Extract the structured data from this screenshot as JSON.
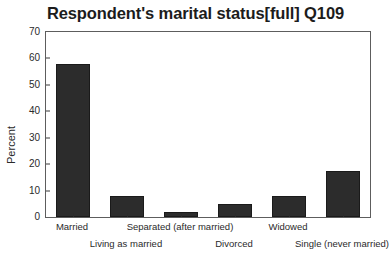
{
  "chart_data": {
    "type": "bar",
    "title": "Respondent's marital status[full] Q109",
    "xlabel": "",
    "ylabel": "Percent",
    "categories": [
      "Married",
      "Living as married",
      "Separated (after married)",
      "Divorced",
      "Widowed",
      "Single (never married)"
    ],
    "values": [
      58,
      8,
      2,
      5,
      8,
      17.5
    ],
    "ylim": [
      0,
      70
    ],
    "yticks": [
      0,
      10,
      20,
      30,
      40,
      50,
      60,
      70
    ],
    "ytick_labels": [
      "0",
      "10",
      "20",
      "30",
      "40",
      "50",
      "60",
      "70"
    ],
    "grid": false,
    "legend": "none",
    "bar_color": "#2c2c2c",
    "bar_edge_color": "#1a1a1a",
    "frame_color": "#5d5d5d",
    "background_color": "#ffffff",
    "label_stagger": [
      0,
      1,
      0,
      1,
      0,
      1
    ]
  }
}
